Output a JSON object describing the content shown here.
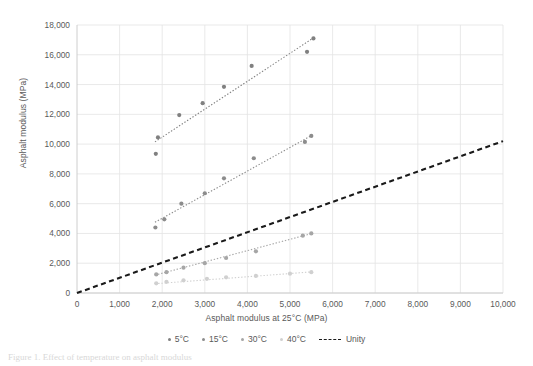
{
  "figure": {
    "caption": "Figure 1. Effect of temperature on asphalt modulus"
  },
  "chart_data": {
    "type": "scatter",
    "title": "",
    "xlabel": "Asphalt modulus at 25°C (MPa)",
    "ylabel": "Asphalt modulus (MPa)",
    "xlim": [
      0,
      10000
    ],
    "ylim": [
      0,
      18000
    ],
    "xticks": [
      "0",
      "1,000",
      "2,000",
      "3,000",
      "4,000",
      "5,000",
      "6,000",
      "7,000",
      "8,000",
      "9,000",
      "10,000"
    ],
    "xtick_values": [
      0,
      1000,
      2000,
      3000,
      4000,
      5000,
      6000,
      7000,
      8000,
      9000,
      10000
    ],
    "yticks": [
      "0",
      "2,000",
      "4,000",
      "6,000",
      "8,000",
      "10,000",
      "12,000",
      "14,000",
      "16,000",
      "18,000"
    ],
    "ytick_values": [
      0,
      2000,
      4000,
      6000,
      8000,
      10000,
      12000,
      14000,
      16000,
      18000
    ],
    "grid": true,
    "legend_position": "bottom",
    "series": [
      {
        "name": "5°C",
        "marker": "circle",
        "color": "#808080",
        "trendline": "dotted",
        "points": [
          [
            1850,
            9350
          ],
          [
            1900,
            10450
          ],
          [
            2400,
            11950
          ],
          [
            2950,
            12750
          ],
          [
            3450,
            13850
          ],
          [
            4100,
            15250
          ],
          [
            5400,
            16200
          ],
          [
            5550,
            17100
          ]
        ],
        "trend": [
          [
            1830,
            10150
          ],
          [
            5560,
            17150
          ]
        ]
      },
      {
        "name": "15°C",
        "marker": "circle",
        "color": "#8c8c8c",
        "trendline": "dotted",
        "points": [
          [
            1840,
            4400
          ],
          [
            2050,
            4950
          ],
          [
            2450,
            6000
          ],
          [
            3000,
            6700
          ],
          [
            3450,
            7700
          ],
          [
            4150,
            9050
          ],
          [
            5350,
            10150
          ],
          [
            5500,
            10550
          ]
        ],
        "trend": [
          [
            1830,
            4750
          ],
          [
            5520,
            10600
          ]
        ]
      },
      {
        "name": "30°C",
        "marker": "circle",
        "color": "#a6a6a6",
        "trendline": "dotted",
        "points": [
          [
            1860,
            1250
          ],
          [
            2100,
            1400
          ],
          [
            2500,
            1700
          ],
          [
            3000,
            2000
          ],
          [
            3500,
            2350
          ],
          [
            4200,
            2800
          ],
          [
            5300,
            3850
          ],
          [
            5500,
            4000
          ]
        ],
        "trend": [
          [
            1830,
            1200
          ],
          [
            5520,
            4000
          ]
        ]
      },
      {
        "name": "40°C",
        "marker": "circle",
        "color": "#d0d0d0",
        "trendline": "dotted",
        "points": [
          [
            1860,
            650
          ],
          [
            2100,
            750
          ],
          [
            2500,
            850
          ],
          [
            3050,
            950
          ],
          [
            3500,
            1050
          ],
          [
            4200,
            1150
          ],
          [
            5000,
            1300
          ],
          [
            5500,
            1400
          ]
        ],
        "trend": [
          [
            1830,
            620
          ],
          [
            5520,
            1420
          ]
        ]
      },
      {
        "name": "Unity",
        "marker": "none",
        "color": "#1a1a1a",
        "trendline": "dashed",
        "points": [],
        "trend": [
          [
            0,
            0
          ],
          [
            10000,
            10200
          ]
        ]
      }
    ]
  }
}
